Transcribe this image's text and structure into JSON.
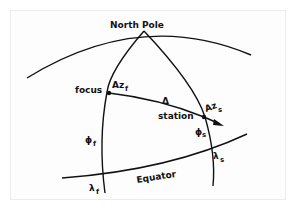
{
  "diagram": {
    "title_label": "North Pole",
    "labels": {
      "focus": "focus",
      "station": "station",
      "equator": "Equator",
      "delta": "Δ",
      "az_f_main": "Az",
      "az_f_sub": "f",
      "az_s_main": "Az",
      "az_s_sub": "s",
      "phi_f_main": "ϕ",
      "phi_f_sub": "f",
      "phi_s_main": "ϕ",
      "phi_s_sub": "s",
      "lambda_f_main": "λ",
      "lambda_f_sub": "f",
      "lambda_s_main": "λ",
      "lambda_s_sub": "s"
    },
    "colors": {
      "line": "#111111",
      "background": "#fdfdfd"
    }
  }
}
